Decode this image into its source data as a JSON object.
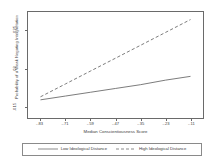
{
  "chart_data": {
    "type": "line",
    "title": "",
    "xlabel": "Median Conscientiousness Score",
    "ylabel": "Probability of a Weak Negating Interpretation",
    "xlim": [
      -0.89,
      -0.05
    ],
    "ylim": [
      0.0135,
      0.0275
    ],
    "xticks": [
      -0.83,
      -0.71,
      -0.59,
      -0.47,
      -0.35,
      -0.23,
      -0.11
    ],
    "xticklabels": [
      "-.83",
      "-.71",
      "-.59",
      "-.47",
      "-.35",
      "-.23",
      "-.11"
    ],
    "yticks": [
      0.015,
      0.02,
      0.025
    ],
    "yticklabels": [
      ".015",
      ".02",
      ".025"
    ],
    "grid": false,
    "legend_position": "bottom",
    "x": [
      -0.83,
      -0.71,
      -0.59,
      -0.47,
      -0.35,
      -0.23,
      -0.11
    ],
    "series": [
      {
        "name": "Low Ideological Distance",
        "style": "solid",
        "color": "#5a5a5a",
        "values": [
          0.0159,
          0.0164,
          0.0169,
          0.0174,
          0.0179,
          0.0185,
          0.019
        ]
      },
      {
        "name": "High Ideological Distance",
        "style": "dashed",
        "color": "#5a5a5a",
        "values": [
          0.0163,
          0.018,
          0.0197,
          0.0214,
          0.0231,
          0.0248,
          0.0265
        ]
      }
    ]
  },
  "legend": {
    "entries": [
      {
        "label": "Low Ideological Distance",
        "style": "solid"
      },
      {
        "label": "High Ideological Distance",
        "style": "dashed"
      }
    ]
  },
  "colors": {
    "axis": "#6a6a6a",
    "text": "#3c3c3c",
    "line": "#5a5a5a",
    "background": "#ffffff"
  }
}
